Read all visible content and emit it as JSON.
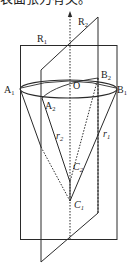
{
  "caption": "表面张力有关。",
  "labels": {
    "R1": {
      "base": "R",
      "sub": "1"
    },
    "R2": {
      "base": "R",
      "sub": "2"
    },
    "A1": {
      "base": "A",
      "sub": "1"
    },
    "A2": {
      "base": "A",
      "sub": "2"
    },
    "B1": {
      "base": "B",
      "sub": "1"
    },
    "B2": {
      "base": "B",
      "sub": "2"
    },
    "O": {
      "base": "O"
    },
    "r1": {
      "base": "r",
      "sub": "1"
    },
    "r2": {
      "base": "r",
      "sub": "2"
    },
    "C1": {
      "base": "C",
      "sub": "1"
    },
    "C2": {
      "base": "C",
      "sub": "2"
    }
  },
  "colors": {
    "stroke": "#2a2a2a",
    "background": "#ffffff"
  }
}
